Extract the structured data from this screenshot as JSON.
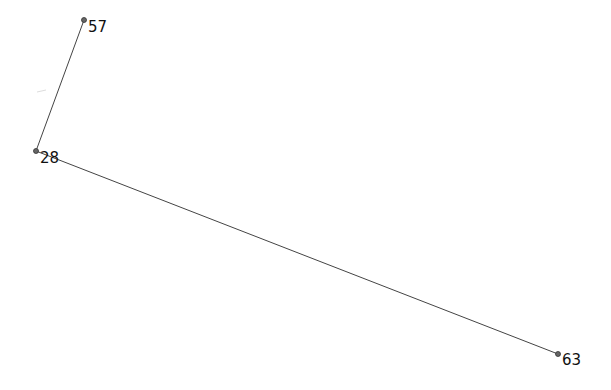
{
  "graph": {
    "nodes": [
      {
        "id": "57",
        "label": "57",
        "x": 84,
        "y": 20
      },
      {
        "id": "28",
        "label": "28",
        "x": 36,
        "y": 151
      },
      {
        "id": "63",
        "label": "63",
        "x": 558,
        "y": 354
      }
    ],
    "edges": [
      {
        "from": "57",
        "to": "28"
      },
      {
        "from": "28",
        "to": "63"
      }
    ]
  },
  "colors": {
    "edge": "#444444",
    "node": "#666666",
    "text": "#111111",
    "background": "#ffffff"
  }
}
